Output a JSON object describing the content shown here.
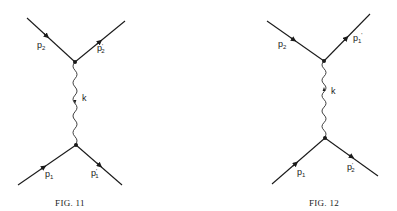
{
  "figures": [
    {
      "id": "fig11",
      "caption": "FIG. 11",
      "photon_label": "k",
      "legs": [
        {
          "position": "upper-left",
          "label": "p",
          "sub": "2",
          "prime": ""
        },
        {
          "position": "upper-right",
          "label": "p",
          "sub": "2",
          "prime": "'"
        },
        {
          "position": "lower-left",
          "label": "p",
          "sub": "1",
          "prime": ""
        },
        {
          "position": "lower-right",
          "label": "p",
          "sub": "1",
          "prime": "'"
        }
      ]
    },
    {
      "id": "fig12",
      "caption": "FIG. 12",
      "photon_label": "k",
      "legs": [
        {
          "position": "upper-left",
          "label": "p",
          "sub": "2",
          "prime": ""
        },
        {
          "position": "upper-right",
          "label": "p",
          "sub": "1",
          "prime": "'"
        },
        {
          "position": "lower-left",
          "label": "p",
          "sub": "1",
          "prime": ""
        },
        {
          "position": "lower-right",
          "label": "p",
          "sub": "2",
          "prime": "'"
        }
      ]
    }
  ],
  "colors": {
    "ink": "#1a1a1a",
    "background": "#ffffff"
  }
}
